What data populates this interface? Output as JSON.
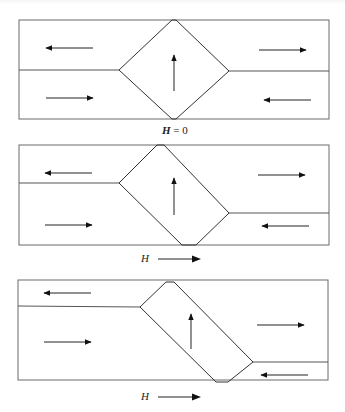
{
  "figure": {
    "colors": {
      "line": "#333333",
      "frame": "#6a6a6a",
      "arrow": "#111111",
      "background": "#ffffff"
    },
    "panels": [
      {
        "id": "panel-1",
        "label_symbol": "H",
        "label_text": " = 0",
        "field_arrow": false,
        "frame": {
          "x": 19,
          "y": 20,
          "w": 310,
          "h": 99
        },
        "left_divider_y": 70,
        "right_divider_y": 71,
        "domain_polygon": [
          [
            172,
            20
          ],
          [
            176,
            20
          ],
          [
            229,
            71
          ],
          [
            176,
            119
          ],
          [
            172,
            119
          ],
          [
            119,
            70
          ]
        ],
        "arrows": [
          {
            "region": "top-left",
            "direction": "left",
            "x1": 93,
            "y1": 48,
            "x2": 46,
            "y2": 48
          },
          {
            "region": "bottom-left",
            "direction": "right",
            "x1": 46,
            "y1": 98,
            "x2": 93,
            "y2": 98
          },
          {
            "region": "center",
            "direction": "up",
            "x1": 174,
            "y1": 91,
            "x2": 174,
            "y2": 55
          },
          {
            "region": "top-right",
            "direction": "right",
            "x1": 259,
            "y1": 50,
            "x2": 306,
            "y2": 50
          },
          {
            "region": "bottom-right",
            "direction": "left",
            "x1": 311,
            "y1": 100,
            "x2": 264,
            "y2": 100
          }
        ]
      },
      {
        "id": "panel-2",
        "label_symbol": "H",
        "label_text": "",
        "field_arrow": true,
        "frame": {
          "x": 19,
          "y": 145,
          "w": 310,
          "h": 100
        },
        "left_divider_y": 183,
        "right_divider_y": 213,
        "domain_polygon": [
          [
            157,
            145
          ],
          [
            164,
            145
          ],
          [
            229,
            213
          ],
          [
            196,
            245
          ],
          [
            182,
            245
          ],
          [
            119,
            183
          ]
        ],
        "arrows": [
          {
            "region": "top-left",
            "direction": "left",
            "x1": 92,
            "y1": 173,
            "x2": 45,
            "y2": 173
          },
          {
            "region": "bottom-left",
            "direction": "right",
            "x1": 45,
            "y1": 225,
            "x2": 92,
            "y2": 225
          },
          {
            "region": "center",
            "direction": "up",
            "x1": 174,
            "y1": 215,
            "x2": 174,
            "y2": 178
          },
          {
            "region": "top-right",
            "direction": "right",
            "x1": 258,
            "y1": 175,
            "x2": 305,
            "y2": 175
          },
          {
            "region": "bottom-right",
            "direction": "left",
            "x1": 309,
            "y1": 226,
            "x2": 262,
            "y2": 226
          }
        ]
      },
      {
        "id": "panel-3",
        "label_symbol": "H",
        "label_text": "",
        "field_arrow": true,
        "frame": {
          "x": 18,
          "y": 280,
          "w": 310,
          "h": 100
        },
        "left_divider_y": 306,
        "right_divider_y": 362,
        "domain_polygon": [
          [
            166,
            282
          ],
          [
            174,
            282
          ],
          [
            253,
            362
          ],
          [
            228,
            382
          ],
          [
            216,
            382
          ],
          [
            140,
            307
          ]
        ],
        "arrows": [
          {
            "region": "top-left",
            "direction": "left",
            "x1": 91,
            "y1": 293,
            "x2": 44,
            "y2": 293
          },
          {
            "region": "bottom-left",
            "direction": "right",
            "x1": 44,
            "y1": 342,
            "x2": 91,
            "y2": 342
          },
          {
            "region": "center",
            "direction": "up",
            "x1": 191,
            "y1": 349,
            "x2": 191,
            "y2": 314
          },
          {
            "region": "right-middle",
            "direction": "right",
            "x1": 257,
            "y1": 325,
            "x2": 304,
            "y2": 325
          },
          {
            "region": "bottom-right",
            "direction": "left",
            "x1": 308,
            "y1": 375,
            "x2": 261,
            "y2": 375
          }
        ]
      }
    ],
    "labels": [
      {
        "panel": "panel-1",
        "symbol": "H",
        "text": " = 0",
        "x": 162,
        "y": 124
      },
      {
        "panel": "panel-2",
        "symbol": "H",
        "text": "",
        "x": 141,
        "y": 252
      },
      {
        "panel": "panel-3",
        "symbol": "H",
        "text": "",
        "x": 141,
        "y": 390
      }
    ]
  }
}
